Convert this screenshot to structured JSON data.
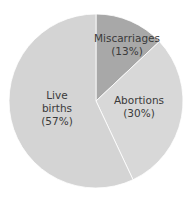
{
  "chart_data": {
    "type": "pie",
    "title": "",
    "categories": [
      "Miscarriages",
      "Abortions",
      "Live births"
    ],
    "values": [
      13,
      30,
      57
    ],
    "labels": [
      "Miscarriages (13%)",
      "Abortions (30%)",
      "Live births (57%)"
    ],
    "colors": [
      "#a8a8a8",
      "#d8d8d8",
      "#d4d4d4"
    ],
    "start_angle_deg": 0,
    "direction": "clockwise",
    "legend": "none"
  },
  "slices": [
    {
      "line1": "Miscarriages",
      "line2": "(13%)"
    },
    {
      "line1": "Abortions",
      "line2": "(30%)"
    },
    {
      "line1": "Live",
      "line2": "births",
      "line3": "(57%)"
    }
  ]
}
